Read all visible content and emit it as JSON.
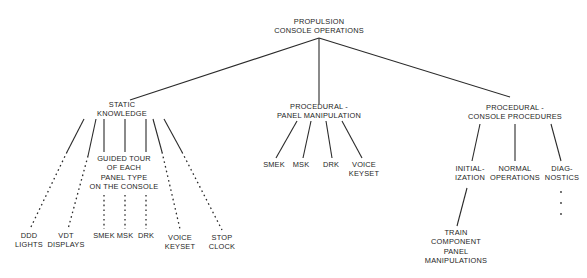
{
  "diagram": {
    "root": {
      "lines": [
        "PROPULSION",
        "CONSOLE OPERATIONS"
      ]
    },
    "branches": {
      "static_knowledge": {
        "lines": [
          "STATIC",
          "KNOWLEDGE"
        ],
        "children": {
          "ddd_lights": {
            "lines": [
              "DDD",
              "LIGHTS"
            ]
          },
          "vdt_displays": {
            "lines": [
              "VDT",
              "DISPLAYS"
            ]
          },
          "guided_tour": {
            "lines": [
              "GUIDED TOUR",
              "OF EACH",
              "PANEL TYPE",
              "ON THE CONSOLE"
            ],
            "children": {
              "smek": {
                "lines": [
                  "SMEK"
                ]
              },
              "msk": {
                "lines": [
                  "MSK"
                ]
              },
              "drk": {
                "lines": [
                  "DRK"
                ]
              }
            }
          },
          "voice_keyset": {
            "lines": [
              "VOICE",
              "KEYSET"
            ]
          },
          "stop_clock": {
            "lines": [
              "STOP",
              "CLOCK"
            ]
          }
        }
      },
      "panel_manipulation": {
        "lines": [
          "PROCEDURAL -",
          "PANEL MANIPULATION"
        ],
        "children": {
          "smek": {
            "lines": [
              "SMEK"
            ]
          },
          "msk": {
            "lines": [
              "MSK"
            ]
          },
          "drk": {
            "lines": [
              "DRK"
            ]
          },
          "voice_keyset": {
            "lines": [
              "VOICE",
              "KEYSET"
            ]
          }
        }
      },
      "console_procedures": {
        "lines": [
          "PROCEDURAL -",
          "CONSOLE PROCEDURES"
        ],
        "children": {
          "initialization": {
            "lines": [
              "INITIAL-",
              "IZATION"
            ],
            "children": {
              "train": {
                "lines": [
                  "TRAIN",
                  "COMPONENT",
                  "PANEL",
                  "MANIPULATIONS"
                ]
              }
            }
          },
          "normal_operations": {
            "lines": [
              "NORMAL",
              "OPERATIONS"
            ]
          },
          "diagnostics": {
            "lines": [
              "DIAG-",
              "NOSTICS"
            ],
            "continuation": "·"
          }
        }
      }
    },
    "colors": {
      "line": "#2a2a2a",
      "text": "#1e1e1e",
      "background": "#ffffff"
    }
  }
}
